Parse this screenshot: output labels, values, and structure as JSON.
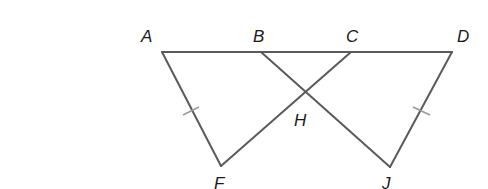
{
  "diagram": {
    "type": "geometry",
    "line_color": "#5a5a5a",
    "tick_color": "#9a9a9a",
    "points": {
      "A": {
        "label": "A",
        "x": 162,
        "y": 52
      },
      "B": {
        "label": "B",
        "x": 261,
        "y": 52
      },
      "C": {
        "label": "C",
        "x": 351,
        "y": 52
      },
      "D": {
        "label": "D",
        "x": 452,
        "y": 52
      },
      "F": {
        "label": "F",
        "x": 221,
        "y": 166
      },
      "H": {
        "label": "H",
        "x": 306,
        "y": 93
      },
      "J": {
        "label": "J",
        "x": 390,
        "y": 167
      }
    },
    "segments": [
      "AD",
      "AF",
      "FC",
      "BJ",
      "DJ"
    ],
    "congruence_marks": [
      "AF",
      "DJ"
    ]
  }
}
